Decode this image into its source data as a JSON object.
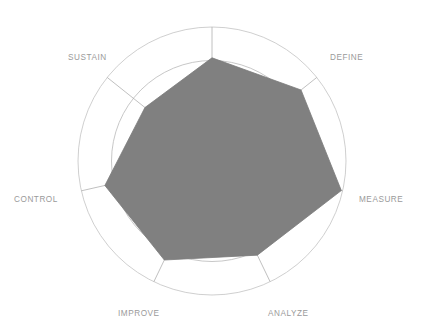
{
  "chart_data": {
    "type": "radar",
    "title": "",
    "subtitle": "",
    "xlabel": "",
    "ylabel": "",
    "grid": true,
    "grid_rings": 4,
    "legend_position": "none",
    "rmin": 0,
    "rmax": 5,
    "categories": [
      "",
      "DEFINE",
      "MEASURE",
      "ANALYZE",
      "IMPROVE",
      "CONTROL",
      "SUSTAIN"
    ],
    "tick_labels": [],
    "annotations": [],
    "series": [
      {
        "name": "Assessment",
        "values": [
          3.85,
          4.25,
          4.95,
          3.9,
          4.1,
          4.1,
          3.2
        ],
        "fill_color": "#808080",
        "line_color": "#7b7b7b"
      }
    ],
    "axes": [
      {
        "label": "",
        "angle_deg": 90,
        "value": 3.85,
        "label_visible": false
      },
      {
        "label": "DEFINE",
        "angle_deg": 38.57,
        "value": 4.25,
        "label_visible": true
      },
      {
        "label": "MEASURE",
        "angle_deg": -12.86,
        "value": 4.95,
        "label_visible": true
      },
      {
        "label": "ANALYZE",
        "angle_deg": -64.29,
        "value": 3.9,
        "label_visible": true
      },
      {
        "label": "IMPROVE",
        "angle_deg": -115.71,
        "value": 4.1,
        "label_visible": true
      },
      {
        "label": "CONTROL",
        "angle_deg": -167.14,
        "value": 4.1,
        "label_visible": true
      },
      {
        "label": "SUSTAIN",
        "angle_deg": 141.43,
        "value": 3.2,
        "label_visible": true
      }
    ]
  },
  "labels": {
    "define": "DEFINE",
    "measure": "MEASURE",
    "analyze": "ANALYZE",
    "improve": "IMPROVE",
    "control": "CONTROL",
    "sustain": "SUSTAIN"
  },
  "colors": {
    "fill": "#808080",
    "grid": "#b9b9b9",
    "label_text": "#9a9a9a",
    "background": "#ffffff"
  },
  "geometry": {
    "center_x": 212,
    "center_y": 161,
    "outer_radius": 134,
    "ring_count": 4,
    "spoke_count": 7
  }
}
